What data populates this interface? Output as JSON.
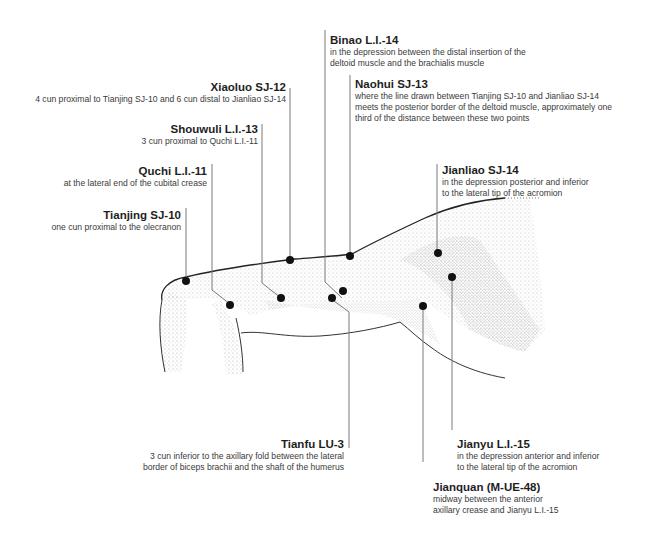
{
  "figure": {
    "colors": {
      "ink": "#1e1e1e",
      "leader_line": "#7a7a7a",
      "point": "#111111",
      "stipple": "#555555"
    }
  },
  "points": [
    {
      "id": "binao",
      "name": "Binao L.I.-14",
      "desc": [
        "in the depression between the distal insertion of the",
        "deltoid muscle and the brachialis muscle"
      ]
    },
    {
      "id": "xiaoluo",
      "name": "Xiaoluo SJ-12",
      "desc": [
        "4 cun proximal to Tianjing SJ-10 and 6 cun distal to Jianliao SJ-14"
      ]
    },
    {
      "id": "naohui",
      "name": "Naohui SJ-13",
      "desc": [
        "where the line drawn between Tianjing SJ-10 and Jianliao SJ-14",
        "meets the posterior border of the deltoid muscle, approximately one",
        "third of the distance between these two points"
      ]
    },
    {
      "id": "shouwuli",
      "name": "Shouwuli L.I.-13",
      "desc": [
        "3 cun proximal to Quchi L.I.-11"
      ]
    },
    {
      "id": "quchi",
      "name": "Quchi L.I.-11",
      "desc": [
        "at the lateral end of the cubital crease"
      ]
    },
    {
      "id": "jianliao",
      "name": "Jianliao SJ-14",
      "desc": [
        "in the depression posterior and inferior",
        "to the lateral tip of the acromion"
      ]
    },
    {
      "id": "tianjing",
      "name": "Tianjing SJ-10",
      "desc": [
        "one cun proximal to the olecranon"
      ]
    },
    {
      "id": "tianfu",
      "name": "Tianfu LU-3",
      "desc": [
        "3 cun inferior to the axillary fold between the lateral",
        "border of biceps brachii and the shaft of the humerus"
      ]
    },
    {
      "id": "jianyu",
      "name": "Jianyu L.I.-15",
      "desc": [
        "in the depression anterior and inferior",
        "to the lateral tip of the acromion"
      ]
    },
    {
      "id": "jianquan",
      "name": "Jianquan (M-UE-48)",
      "desc": [
        "midway between the anterior",
        "axillary crease and Jianyu L.I.-15"
      ]
    }
  ]
}
